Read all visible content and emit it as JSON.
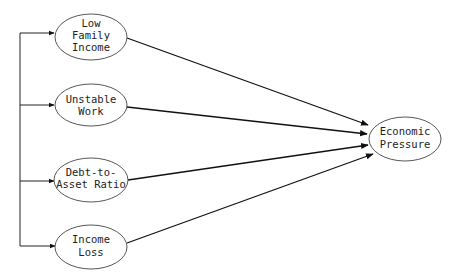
{
  "diagram": {
    "type": "path-model",
    "predictors": [
      {
        "id": "low-family-income",
        "lines": [
          "Low",
          "Family",
          "Income"
        ]
      },
      {
        "id": "unstable-work",
        "lines": [
          "Unstable",
          "Work"
        ]
      },
      {
        "id": "debt-to-asset-ratio",
        "lines": [
          "Debt-to-",
          "Asset Ratio"
        ]
      },
      {
        "id": "income-loss",
        "lines": [
          "Income",
          "Loss"
        ]
      }
    ],
    "outcome": {
      "id": "economic-pressure",
      "lines": [
        "Economic",
        "Pressure"
      ]
    },
    "edges": [
      {
        "from": "low-family-income",
        "to": "economic-pressure"
      },
      {
        "from": "unstable-work",
        "to": "economic-pressure"
      },
      {
        "from": "debt-to-asset-ratio",
        "to": "economic-pressure"
      },
      {
        "from": "income-loss",
        "to": "economic-pressure"
      }
    ],
    "correlation_bracket": "predictors linked by left-side bracket with arrows into each predictor",
    "colors": {
      "line": "#111111",
      "ellipse_stroke": "#444444",
      "background": "#ffffff"
    }
  }
}
